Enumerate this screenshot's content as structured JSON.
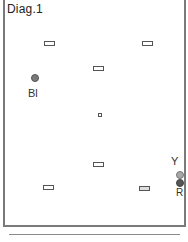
{
  "diagram": {
    "title": "Diag.1",
    "elements": [
      {
        "type": "rect",
        "name": "marker-top-left",
        "x": 44,
        "y": 41
      },
      {
        "type": "rect",
        "name": "marker-top-right",
        "x": 142,
        "y": 41
      },
      {
        "type": "rect",
        "name": "marker-upper-center",
        "x": 93,
        "y": 66
      },
      {
        "type": "square",
        "name": "marker-center",
        "x": 98,
        "y": 113
      },
      {
        "type": "rect",
        "name": "marker-lower-center",
        "x": 93,
        "y": 162
      },
      {
        "type": "rect",
        "name": "marker-bottom-left",
        "x": 43,
        "y": 185
      },
      {
        "type": "rect",
        "name": "marker-bottom-right",
        "x": 139,
        "y": 186
      }
    ],
    "points": [
      {
        "label": "Bl",
        "color": "#7a7a7a",
        "dot_x": 31,
        "dot_y": 74,
        "label_x": 28,
        "label_y": 88
      },
      {
        "label": "Y",
        "color": "#9a9a9a",
        "dot_x": 176,
        "dot_y": 171,
        "label_x": 171,
        "label_y": 156
      },
      {
        "label": "R",
        "color": "#555555",
        "dot_x": 176,
        "dot_y": 179,
        "label_x": 176,
        "label_y": 187
      }
    ]
  }
}
